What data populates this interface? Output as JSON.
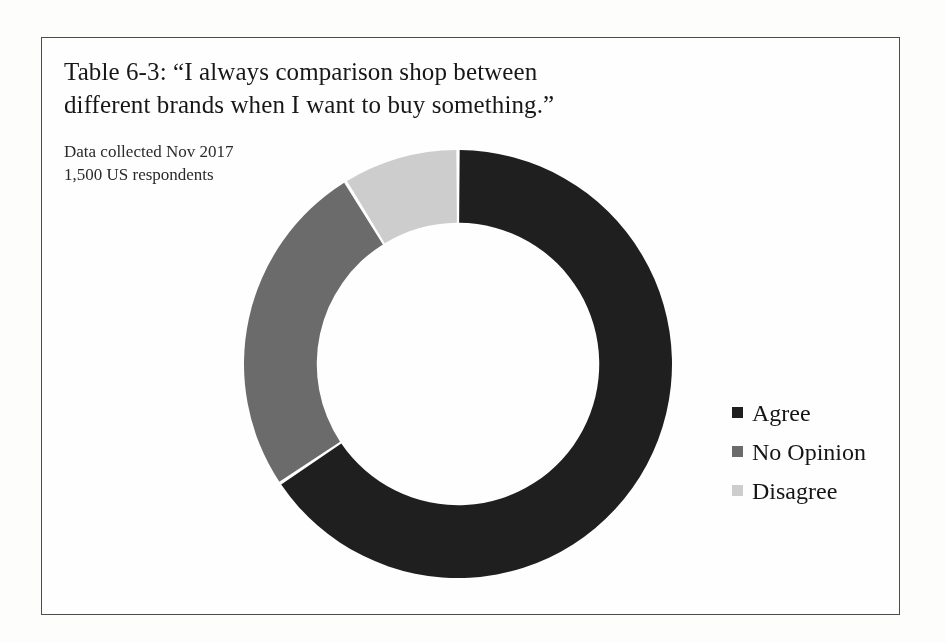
{
  "figure": {
    "title": "Table 6-3: “I always comparison shop between different brands when I want to buy something.”",
    "subtitle_line1": "Data collected Nov 2017",
    "subtitle_line2": "1,500 US respondents"
  },
  "legend": {
    "items": [
      {
        "label": "Agree",
        "color": "#1f1f1f"
      },
      {
        "label": "No Opinion",
        "color": "#6b6b6b"
      },
      {
        "label": "Disagree",
        "color": "#cdcdcd"
      }
    ]
  },
  "chart_data": {
    "type": "pie",
    "variant": "donut",
    "title": "Table 6-3: “I always comparison shop between different brands when I want to buy something.”",
    "subtitle": "Data collected Nov 2017 / 1,500 US respondents",
    "categories": [
      "Agree",
      "No Opinion",
      "Disagree"
    ],
    "values": [
      65.6,
      25.6,
      8.8
    ],
    "unit": "percent",
    "colors": [
      "#1f1f1f",
      "#6b6b6b",
      "#cdcdcd"
    ],
    "start_angle_deg": 0,
    "direction": "clockwise",
    "inner_radius_ratio": 0.66,
    "legend_position": "right",
    "data_labels": false,
    "grid": false
  }
}
